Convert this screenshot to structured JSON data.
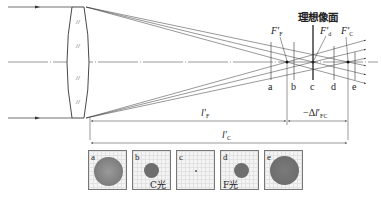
{
  "title": "理想像面",
  "focal_labels": {
    "F": {
      "main": "F",
      "prime": "′",
      "sub": "F"
    },
    "d": {
      "main": "F",
      "prime": "′",
      "sub": "d"
    },
    "C": {
      "main": "F",
      "prime": "′",
      "sub": "C"
    }
  },
  "planes": [
    "a",
    "b",
    "c",
    "d",
    "e"
  ],
  "dimensions": {
    "lF": {
      "main": "l",
      "prime": "′",
      "sub": "F"
    },
    "lC": {
      "main": "l",
      "prime": "′",
      "sub": "C"
    },
    "delta": {
      "prefix": "−Δ",
      "main": "l",
      "prime": "′",
      "sub": "FC"
    }
  },
  "spots": [
    {
      "letter": "a",
      "caption": ""
    },
    {
      "letter": "b",
      "caption": "C光"
    },
    {
      "letter": "c",
      "caption": ""
    },
    {
      "letter": "d",
      "caption": "F光"
    },
    {
      "letter": "e",
      "caption": ""
    }
  ],
  "colors": {
    "line": "#333333",
    "spot": "#707070",
    "grid": "#e2e2e2"
  }
}
